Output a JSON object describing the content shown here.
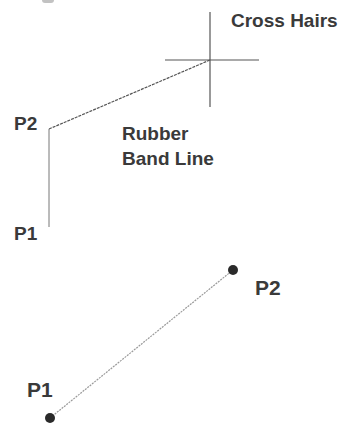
{
  "figure": {
    "type": "rubber-band-line-illustration",
    "colors": {
      "text": "#3a3a3a",
      "crosshair": "#555555",
      "rubber_band_line": "#555555",
      "guide_line": "#777777",
      "final_line": "#9a9a9a",
      "point_marker": "#2a2a2a"
    }
  },
  "top_diagram": {
    "crosshairs_label": "Cross Hairs",
    "rubber_band_label_line1": "Rubber",
    "rubber_band_label_line2": "Band Line",
    "p2_label": "P2",
    "p1_label": "P1",
    "crosshair_center": [
      210,
      60
    ],
    "crosshair_arm": 47,
    "p2_point": [
      49,
      129
    ],
    "p1_point": [
      49,
      227
    ]
  },
  "bottom_diagram": {
    "p2_label": "P2",
    "p1_label": "P1",
    "p2_point": [
      233,
      270
    ],
    "p1_point": [
      50,
      418
    ],
    "marker_radius": 5
  }
}
